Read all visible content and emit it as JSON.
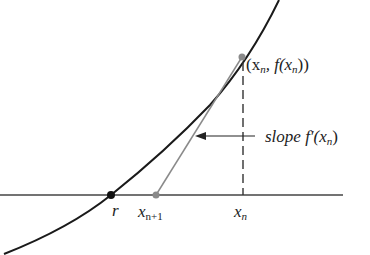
{
  "diagram": {
    "labels": {
      "point": "(x",
      "point_sub": "n",
      "point_mid": ", f(x",
      "point_sub2": "n",
      "point_end": "))",
      "slope_prefix": "slope f′(x",
      "slope_sub": "n",
      "slope_end": ")",
      "root": "r",
      "xn1": "x",
      "xn1_sub": "n+1",
      "xn": "x",
      "xn_sub": "n"
    },
    "colors": {
      "curve": "#1a1a1a",
      "tangent": "#888888",
      "axis": "#333333",
      "point_gray": "#8a8a8a",
      "root_dot": "#111111"
    },
    "points": {
      "root": [
        111,
        195
      ],
      "xn1": [
        156,
        195
      ],
      "xn": [
        243,
        195
      ],
      "fxn": [
        242,
        57
      ]
    }
  }
}
